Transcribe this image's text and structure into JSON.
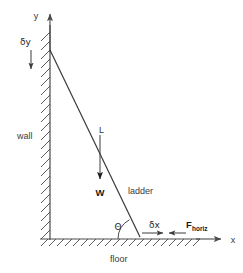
{
  "diagram": {
    "colors": {
      "structure": "#4a4a4a",
      "ladder": "#3a3a3a",
      "text": "#333333",
      "arrow": "#555555",
      "bold_text": "#111111",
      "background": "#ffffff"
    },
    "labels": {
      "y_axis": "y",
      "x_axis": "x",
      "delta_y": "δy",
      "delta_x": "δx",
      "wall": "wall",
      "floor": "floor",
      "ladder": "ladder",
      "ladder_length": "L",
      "weight": "W",
      "theta": "Θ",
      "force_base": "F",
      "force_subscript": "horiz"
    },
    "geometry": {
      "wall_x": 50,
      "wall_top_y": 25,
      "floor_y": 239,
      "floor_left_x": 40,
      "floor_right_x": 200,
      "ladder_top": [
        50,
        50
      ],
      "ladder_bottom": [
        140,
        237
      ],
      "y_axis_arrow_tip_y": 10,
      "x_axis_arrow_tip_x": 226,
      "weight_arrow_from": [
        100,
        135
      ],
      "weight_arrow_to": [
        100,
        183
      ],
      "delta_y_arrow_from": [
        31,
        50
      ],
      "delta_y_arrow_to": [
        31,
        73
      ],
      "delta_x_arrow_right_from": [
        142,
        233
      ],
      "delta_x_arrow_right_to": [
        166,
        233
      ],
      "force_arrow_left_from": [
        186,
        233
      ],
      "force_arrow_left_to": [
        166,
        233
      ],
      "angle_arc_radius": 22
    }
  }
}
